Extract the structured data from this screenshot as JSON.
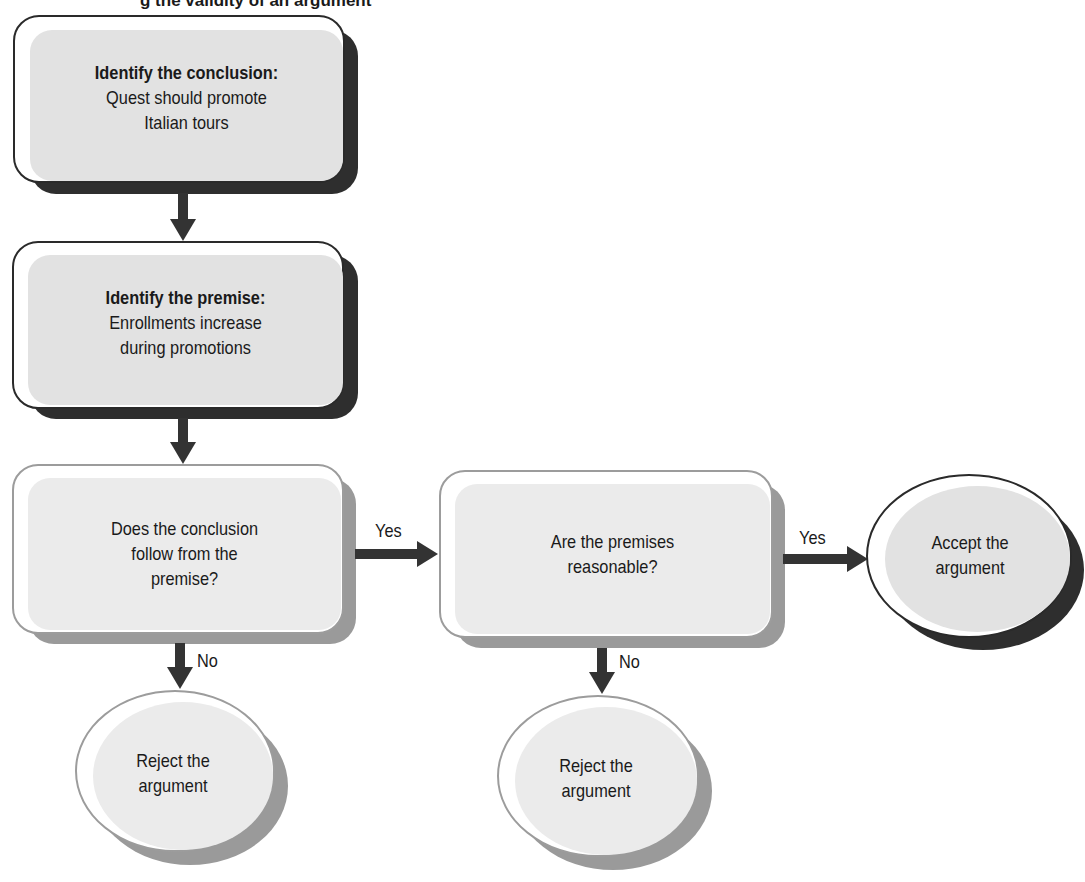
{
  "title": "g the validity of an argument",
  "nodes": {
    "conclusion": {
      "heading": "Identify the conclusion:",
      "line1": "Quest should promote",
      "line2": "Italian tours"
    },
    "premise": {
      "heading": "Identify the premise:",
      "line1": "Enrollments increase",
      "line2": "during promotions"
    },
    "follows": {
      "line1": "Does the conclusion",
      "line2": "follow from the",
      "line3": "premise?"
    },
    "reasonable": {
      "line1": "Are the premises",
      "line2": "reasonable?"
    },
    "accept": {
      "line1": "Accept the",
      "line2": "argument"
    },
    "reject1": {
      "line1": "Reject the",
      "line2": "argument"
    },
    "reject2": {
      "line1": "Reject the",
      "line2": "argument"
    }
  },
  "edges": {
    "follows_yes": "Yes",
    "follows_no": "No",
    "reasonable_yes": "Yes",
    "reasonable_no": "No"
  },
  "colors": {
    "dark_outline": "#2a2a2a",
    "dark_shadow": "#2e2e2e",
    "light_outline": "#9c9c9c",
    "light_shadow": "#9a9a9a",
    "fill": "#e2e2e2"
  }
}
